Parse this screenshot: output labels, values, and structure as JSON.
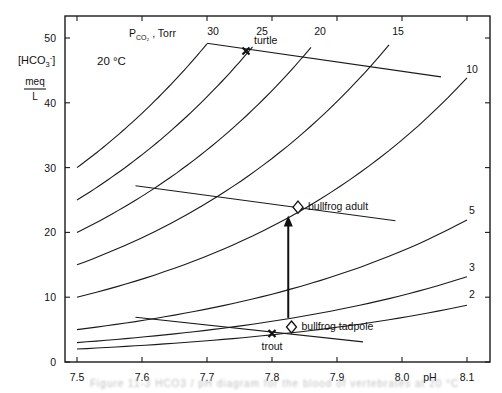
{
  "chart_data": {
    "type": "line",
    "title": "",
    "xlabel": "pH",
    "ylabel": "[HCO3-] meq/L",
    "ylabel_parts": {
      "top": "[HCO",
      "sub": "3",
      "sup": "-",
      "close": "]",
      "unit_num": "meq",
      "unit_den": "L"
    },
    "xlim": [
      7.5,
      8.1
    ],
    "ylim": [
      0,
      50
    ],
    "xticks": [
      7.5,
      7.6,
      7.7,
      7.8,
      7.9,
      8.0,
      8.1
    ],
    "xtick_labels": [
      "7.5",
      "7.6",
      "7.7",
      "7.8",
      "7.9",
      "8.0",
      "8.1"
    ],
    "yticks": [
      0,
      10,
      20,
      30,
      40,
      50
    ],
    "ytick_labels": [
      "0",
      "10",
      "20",
      "30",
      "40",
      "50"
    ],
    "grid": false,
    "annotations": {
      "temperature": "20 °C",
      "isopleth_title": {
        "main": "P",
        "sub": "CO₂",
        "rest": " , Torr"
      }
    },
    "isopleth_rule": "HCO3 = PCO2 * 10^(1.07*(pH-7.5))",
    "series": [
      {
        "name": "PCO2 30 Torr",
        "pco2": 30,
        "label": "30",
        "ph_range": [
          7.5,
          7.7
        ]
      },
      {
        "name": "PCO2 25 Torr",
        "pco2": 25,
        "label": "25",
        "ph_range": [
          7.5,
          7.77
        ]
      },
      {
        "name": "PCO2 20 Torr",
        "pco2": 20,
        "label": "20",
        "ph_range": [
          7.5,
          7.86
        ]
      },
      {
        "name": "PCO2 15 Torr",
        "pco2": 15,
        "label": "15",
        "ph_range": [
          7.5,
          7.98
        ]
      },
      {
        "name": "PCO2 10 Torr",
        "pco2": 10,
        "label": "10",
        "ph_range": [
          7.5,
          8.1
        ]
      },
      {
        "name": "PCO2 5 Torr",
        "pco2": 5,
        "label": "5",
        "ph_range": [
          7.5,
          8.1
        ]
      },
      {
        "name": "PCO2 3 Torr",
        "pco2": 3,
        "label": "3",
        "ph_range": [
          7.5,
          8.1
        ]
      },
      {
        "name": "PCO2 2 Torr",
        "pco2": 2,
        "label": "2",
        "ph_range": [
          7.5,
          8.1
        ]
      }
    ],
    "buffer_lines": [
      {
        "name": "turtle buffer line",
        "from": [
          7.7,
          49.2
        ],
        "to": [
          8.06,
          44.0
        ]
      },
      {
        "name": "bullfrog adult buffer line",
        "from": [
          7.59,
          27.2
        ],
        "to": [
          7.99,
          21.8
        ]
      },
      {
        "name": "trout buffer line",
        "from": [
          7.59,
          6.9
        ],
        "to": [
          7.94,
          3.1
        ]
      }
    ],
    "points": [
      {
        "name": "turtle",
        "label": "turtle",
        "marker": "x",
        "ph": 7.76,
        "hco3": 48.0
      },
      {
        "name": "bullfrog adult",
        "label": "bullfrog adult",
        "marker": "diamond",
        "ph": 7.84,
        "hco3": 23.9
      },
      {
        "name": "bullfrog tadpole",
        "label": "bullfrog tadpole",
        "marker": "diamond",
        "ph": 7.83,
        "hco3": 5.4
      },
      {
        "name": "trout",
        "label": "trout",
        "marker": "x",
        "ph": 7.8,
        "hco3": 4.4
      }
    ],
    "arrows": [
      {
        "name": "tadpole to adult transition",
        "from": [
          7.825,
          6.8
        ],
        "to": [
          7.825,
          22.6
        ]
      }
    ]
  },
  "caption": "Figure 11-3   HCO3 / pH diagram for the blood of vertebrates at 20 °C"
}
